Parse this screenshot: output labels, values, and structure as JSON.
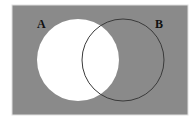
{
  "diagram": {
    "type": "venn",
    "universe": {
      "fill": "#8a8a8a",
      "border": "#d8d8d8"
    },
    "sets": [
      {
        "id": "A",
        "label": "A",
        "fill": "#ffffff",
        "stroke": "#ffffff"
      },
      {
        "id": "B",
        "label": "B",
        "fill": "none",
        "stroke": "#3a3a3a"
      }
    ],
    "shaded_region": "complement of A",
    "unshaded_region": "A"
  }
}
